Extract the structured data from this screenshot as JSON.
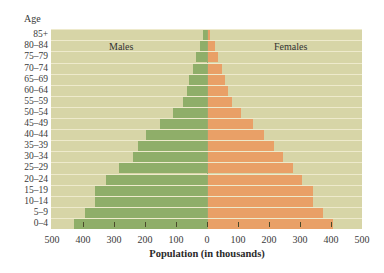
{
  "chart_data": {
    "type": "bar",
    "subtype": "population-pyramid",
    "title": "",
    "xlabel": "Population (in thousands)",
    "ylabel": "Age",
    "xlim": [
      -500,
      500
    ],
    "x_ticks": [
      "500",
      "400",
      "300",
      "200",
      "100",
      "0",
      "100",
      "200",
      "300",
      "400",
      "500"
    ],
    "categories": [
      "0–4",
      "5–9",
      "10–14",
      "15–19",
      "20–24",
      "25–29",
      "30–34",
      "35–39",
      "40–44",
      "45–49",
      "50–54",
      "55–59",
      "60–64",
      "65–69",
      "70–74",
      "75–79",
      "80–84",
      "85+"
    ],
    "series": [
      {
        "name": "Males",
        "color": "#8fae69",
        "values": [
          430,
          395,
          360,
          360,
          325,
          285,
          240,
          222,
          197,
          152,
          110,
          77,
          65,
          58,
          45,
          35,
          23,
          13
        ]
      },
      {
        "name": "Females",
        "color": "#e9a067",
        "values": [
          403,
          371,
          339,
          339,
          303,
          274,
          242,
          213,
          181,
          145,
          106,
          77,
          65,
          55,
          45,
          32,
          23,
          8
        ]
      }
    ],
    "legend": {
      "position": "inside-top",
      "entries": [
        "Males",
        "Females"
      ]
    },
    "grid": false,
    "background_color": "#d7d5a7"
  },
  "labels": {
    "age_header": "Age",
    "males": "Males",
    "females": "Females",
    "xlabel": "Population (in thousands)"
  }
}
